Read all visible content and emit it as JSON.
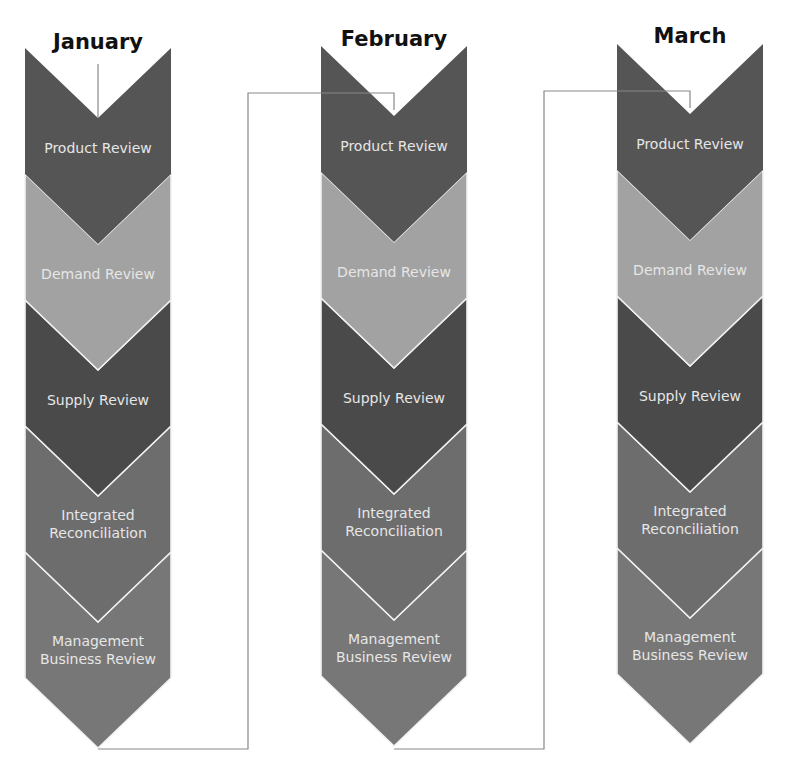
{
  "diagram": {
    "colors": {
      "product_review": "#555555",
      "demand_review": "#a2a2a2",
      "supply_review": "#4a4a4a",
      "integrated_reconciliation": "#6d6d6d",
      "management_business_review": "#777777",
      "separator": "#f2f2f2",
      "connector": "#888888"
    },
    "steps": [
      {
        "key": "product_review",
        "label": "Product Review"
      },
      {
        "key": "demand_review",
        "label": "Demand Review"
      },
      {
        "key": "supply_review",
        "label": "Supply Review"
      },
      {
        "key": "integrated_reconciliation",
        "label": "Integrated\nReconciliation"
      },
      {
        "key": "management_business_review",
        "label": "Management\nBusiness Review"
      }
    ],
    "months": [
      {
        "name": "January",
        "center_x": 98,
        "top_y": 48,
        "title_y": 30
      },
      {
        "name": "February",
        "center_x": 394,
        "top_y": 46,
        "title_y": 27
      },
      {
        "name": "March",
        "center_x": 690,
        "top_y": 44,
        "title_y": 24
      }
    ],
    "geometry": {
      "half_width": 73,
      "band_height": 126,
      "chevron_depth": 70
    }
  },
  "m0": {
    "name": "January",
    "s0": "Product Review",
    "s1": "Demand Review",
    "s2": "Supply Review",
    "s3": "Integrated\nReconciliation",
    "s4": "Management\nBusiness Review"
  },
  "m1": {
    "name": "February",
    "s0": "Product Review",
    "s1": "Demand Review",
    "s2": "Supply Review",
    "s3": "Integrated\nReconciliation",
    "s4": "Management\nBusiness Review"
  },
  "m2": {
    "name": "March",
    "s0": "Product Review",
    "s1": "Demand Review",
    "s2": "Supply Review",
    "s3": "Integrated\nReconciliation",
    "s4": "Management\nBusiness Review"
  }
}
